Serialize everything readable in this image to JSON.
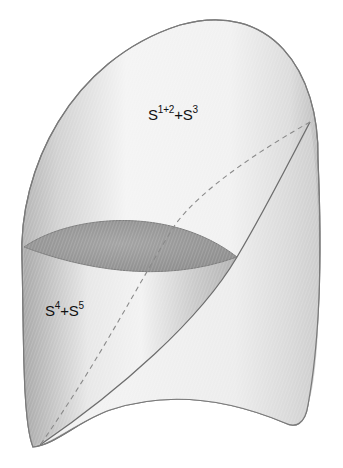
{
  "diagram": {
    "type": "anatomical-surface-illustration",
    "regions": [
      {
        "id": "upper-region",
        "label_base1": "S",
        "label_sup1": "1+2",
        "label_plus": "+",
        "label_base2": "S",
        "label_sup2": "3",
        "full_label": "S1+2+S3"
      },
      {
        "id": "lower-region",
        "label_base1": "S",
        "label_sup1": "4",
        "label_plus": "+",
        "label_base2": "S",
        "label_sup2": "5",
        "full_label": "S4+S5"
      }
    ],
    "lines": {
      "dashed": "hidden segment boundary (dashed)",
      "solid": "visible segment boundary (solid)"
    },
    "colors": {
      "surface_light": "#f4f4f4",
      "surface_mid": "#d9d9d9",
      "surface_dark": "#a8a8a8",
      "cut_face": "#9a9a9a",
      "outline": "#7a7a7a",
      "boundary_line": "#6e6e6e",
      "dashed_line": "#8a8a8a",
      "text": "#111111"
    }
  }
}
